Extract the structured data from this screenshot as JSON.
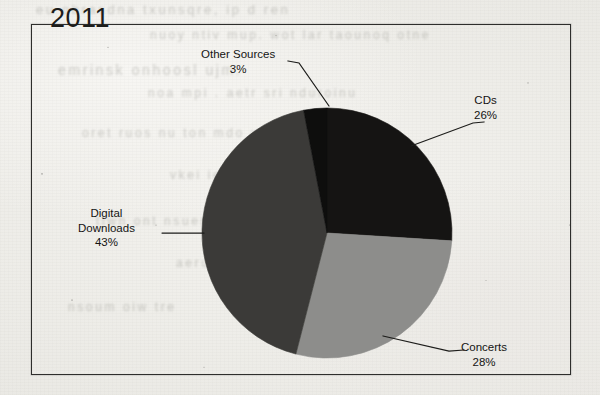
{
  "page": {
    "background_color": "#efeeea",
    "bleed_through_lines": [
      {
        "text": "eu  obrasdna  txunsqre,  ip  d  ren",
        "x": 36,
        "y": 2,
        "size": 13
      },
      {
        "text": "nuoy ntiv  mup.  wot  lar  taounoq  otne",
        "x": 150,
        "y": 28,
        "size": 12
      },
      {
        "text": "emrinsk  onhoosl  ujm.",
        "x": 58,
        "y": 62,
        "size": 14
      },
      {
        "text": "noa  mpi  .   aetr  sri   nduroinu",
        "x": 148,
        "y": 86,
        "size": 12
      },
      {
        "text": "oret  ruos  nu  ton  mdo  urit",
        "x": 82,
        "y": 126,
        "size": 12
      },
      {
        "text": "vkei  ieoh  cuos  mne",
        "x": 170,
        "y": 168,
        "size": 12
      },
      {
        "text": "tiwn  ont  nsuer  oi  ts",
        "x": 96,
        "y": 214,
        "size": 12
      },
      {
        "text": "aerun  doc  lmei",
        "x": 176,
        "y": 256,
        "size": 12
      },
      {
        "text": "nsoum  oiw  tre",
        "x": 68,
        "y": 300,
        "size": 12
      }
    ]
  },
  "chart": {
    "frame": {
      "x": 31,
      "y": 24,
      "width": 540,
      "height": 351,
      "border_color": "#2e2e2c"
    },
    "title": "2011",
    "leader_line_color": "#1d1d1b"
  },
  "chart_data": {
    "type": "pie",
    "title": "2011",
    "xlabel": "",
    "ylabel": "",
    "legend_position": "none",
    "grid": false,
    "units": "percent",
    "start_angle_deg": 0,
    "direction": "clockwise",
    "center": {
      "x": 327,
      "y": 233
    },
    "radius": 125,
    "categories": [
      "CDs",
      "Concerts",
      "Digital Downloads",
      "Other Sources"
    ],
    "values": [
      26,
      28,
      43,
      3
    ],
    "colors": [
      "#151413",
      "#8d8d8b",
      "#3b3a38",
      "#0e0e0d"
    ],
    "slices": [
      {
        "label": "CDs",
        "percent": 26,
        "value_text": "26%",
        "color": "#151413",
        "start_deg": 0,
        "end_deg": 93.6
      },
      {
        "label": "Concerts",
        "percent": 28,
        "value_text": "28%",
        "color": "#8d8d8b",
        "start_deg": 93.6,
        "end_deg": 194.4
      },
      {
        "label": "Digital Downloads",
        "percent": 43,
        "value_text": "43%",
        "color": "#3b3a38",
        "start_deg": 194.4,
        "end_deg": 349.2
      },
      {
        "label": "Other Sources",
        "percent": 3,
        "value_text": "3%",
        "color": "#0e0e0d",
        "start_deg": 349.2,
        "end_deg": 360
      }
    ]
  },
  "labels": {
    "other_sources": {
      "name": "Other Sources",
      "percent": "3%"
    },
    "cds": {
      "name": "CDs",
      "percent": "26%"
    },
    "concerts": {
      "name": "Concerts",
      "percent": "28%"
    },
    "digital_downloads_line1": "Digital",
    "digital_downloads_line2": "Downloads",
    "digital_downloads_percent": "43%"
  }
}
